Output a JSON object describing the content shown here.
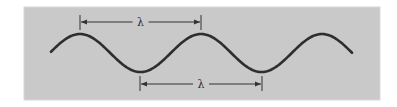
{
  "diagram": {
    "colors": {
      "page_background": "#ffffff",
      "panel_background": "#c9c9c9",
      "panel_border": "#d8d8d8",
      "wave_stroke": "#2e2e2e",
      "annotation_stroke": "#333333"
    },
    "panel": {
      "x": 24,
      "y": 7,
      "width": 356,
      "height": 93
    },
    "wave": {
      "type": "sine",
      "x_start": 51,
      "x_end": 352,
      "center_y": 53,
      "amplitude": 19,
      "wavelength_px": 121,
      "crest_x": [
        80,
        201,
        321
      ],
      "trough_x": [
        140,
        262
      ],
      "stroke_width": 2.6
    },
    "annotations": [
      {
        "id": "top-wavelength",
        "label": "λ",
        "description": "crest to crest",
        "x1": 80,
        "x2": 201,
        "y": 22,
        "tick_top": 15,
        "tick_bottom": 30
      },
      {
        "id": "bottom-wavelength",
        "label": "λ",
        "description": "trough to trough",
        "x1": 140,
        "x2": 262,
        "y": 84,
        "tick_top": 76,
        "tick_bottom": 91
      }
    ]
  }
}
